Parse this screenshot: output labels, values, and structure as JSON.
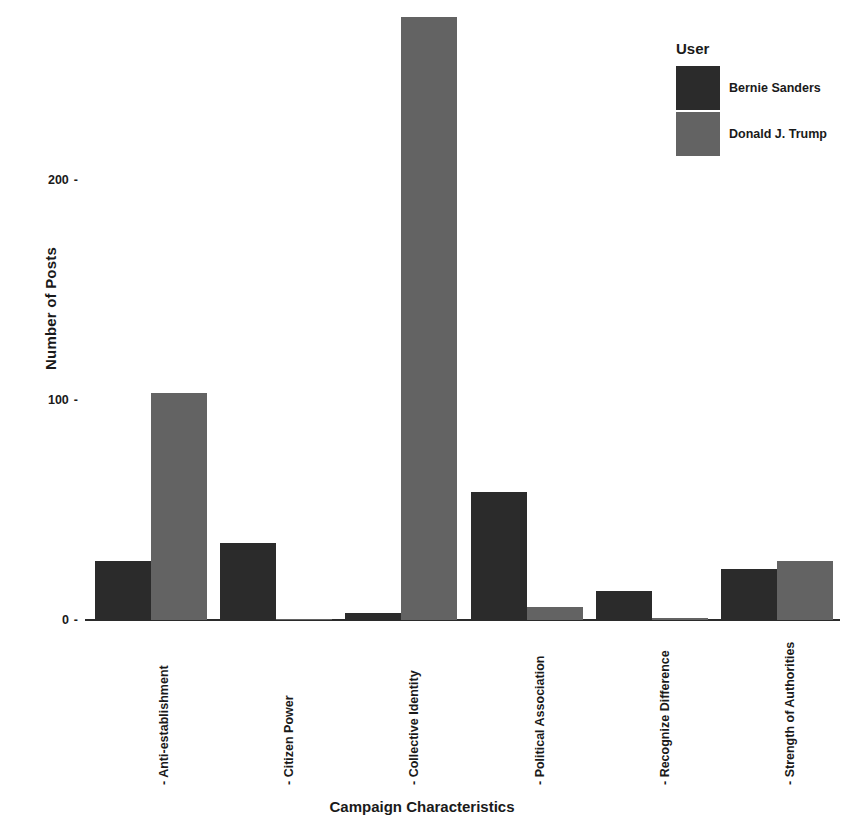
{
  "chart_data": {
    "type": "bar",
    "title": "",
    "xlabel": "Campaign Characteristics",
    "ylabel": "Number of Posts",
    "categories": [
      "Anti-establishment",
      "Citizen Power",
      "Collective Identity",
      "Political Association",
      "Recognize Difference",
      "Strength of Authorities"
    ],
    "series": [
      {
        "name": "Bernie Sanders",
        "color": "#2b2b2b",
        "values": [
          27,
          35,
          3,
          58,
          13,
          23
        ]
      },
      {
        "name": "Donald J. Trump",
        "color": "#636363",
        "values": [
          103,
          0,
          274,
          6,
          1,
          27
        ]
      }
    ],
    "yticks": [
      0,
      100,
      200
    ],
    "ytick_labels": [
      "0",
      "100",
      "200"
    ],
    "ylim": [
      0,
      280
    ],
    "grid": false,
    "legend": {
      "title": "User",
      "position": "top-right"
    },
    "tick_mark": "-"
  }
}
